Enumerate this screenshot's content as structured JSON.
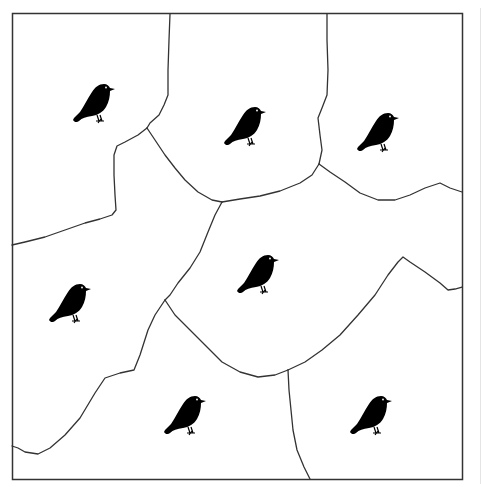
{
  "figure": {
    "frame": {
      "x": 12,
      "y": 13,
      "width": 451,
      "height": 467,
      "stroke": "#333333"
    },
    "boundary_color": "#333333",
    "bird_color": "#000000",
    "background": "#ffffff",
    "territory_count": 7,
    "birds": [
      {
        "id": "bird-1",
        "x": 94,
        "y": 104
      },
      {
        "id": "bird-2",
        "x": 245,
        "y": 127
      },
      {
        "id": "bird-3",
        "x": 378,
        "y": 133
      },
      {
        "id": "bird-4",
        "x": 258,
        "y": 275
      },
      {
        "id": "bird-5",
        "x": 70,
        "y": 304
      },
      {
        "id": "bird-6",
        "x": 185,
        "y": 416
      },
      {
        "id": "bird-7",
        "x": 371,
        "y": 416
      }
    ]
  }
}
